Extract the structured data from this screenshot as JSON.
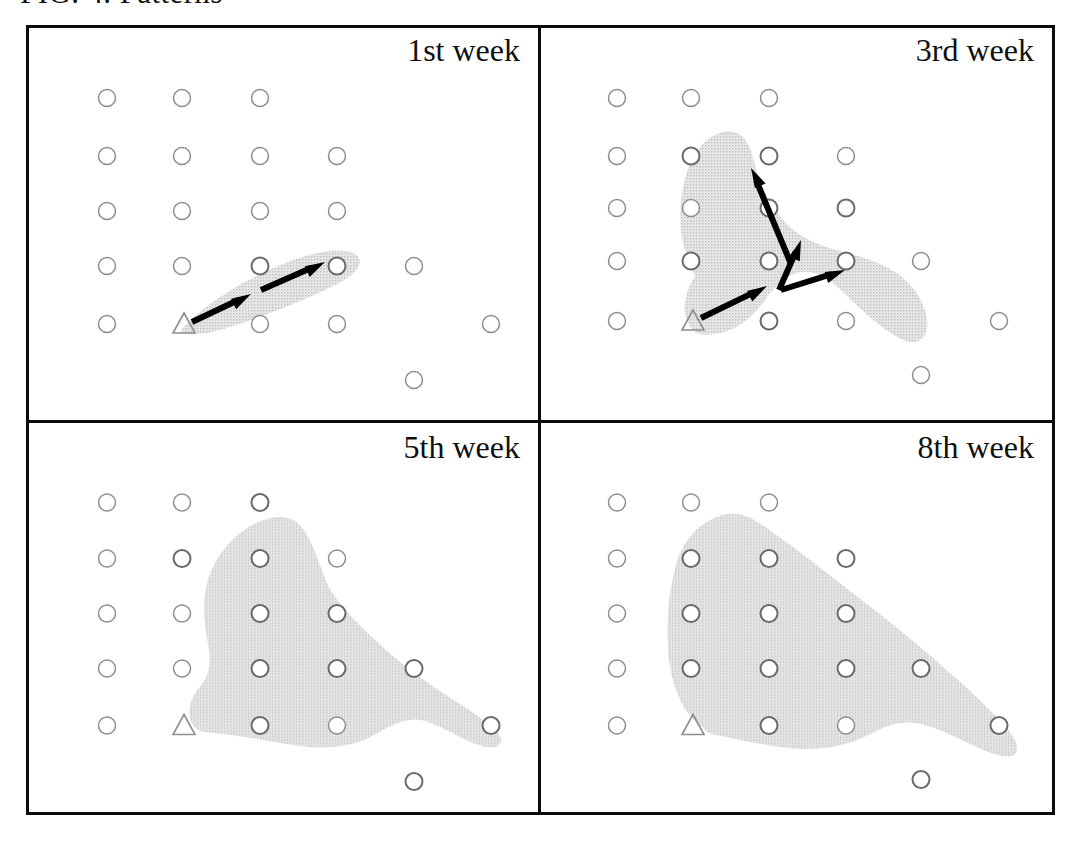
{
  "figure": {
    "caption": "FIG. 4. Patterns",
    "colors": {
      "frame": "#0b0b0b",
      "shade_fill": "#d9d9d9",
      "node_stroke": "#8e8e8e",
      "node_stroke_active": "#6a6a6a",
      "arrow": "#000000",
      "background": "#ffffff"
    },
    "legend_symbols": {
      "circle": "site-node",
      "triangle": "origin-node",
      "shaded_region": "diffusion-extent",
      "arrow": "spread-direction"
    }
  },
  "panels": [
    {
      "id": "panel-1st-week",
      "label": "1st week",
      "nodes": [
        {
          "x": 78,
          "y": 70,
          "shape": "circle",
          "inside": false
        },
        {
          "x": 153,
          "y": 70,
          "shape": "circle",
          "inside": false
        },
        {
          "x": 231,
          "y": 70,
          "shape": "circle",
          "inside": false
        },
        {
          "x": 78,
          "y": 128,
          "shape": "circle",
          "inside": false
        },
        {
          "x": 153,
          "y": 128,
          "shape": "circle",
          "inside": false
        },
        {
          "x": 231,
          "y": 128,
          "shape": "circle",
          "inside": false
        },
        {
          "x": 308,
          "y": 128,
          "shape": "circle",
          "inside": false
        },
        {
          "x": 78,
          "y": 183,
          "shape": "circle",
          "inside": false
        },
        {
          "x": 153,
          "y": 183,
          "shape": "circle",
          "inside": false
        },
        {
          "x": 231,
          "y": 183,
          "shape": "circle",
          "inside": false
        },
        {
          "x": 308,
          "y": 183,
          "shape": "circle",
          "inside": false
        },
        {
          "x": 78,
          "y": 238,
          "shape": "circle",
          "inside": false
        },
        {
          "x": 153,
          "y": 238,
          "shape": "circle",
          "inside": false
        },
        {
          "x": 231,
          "y": 238,
          "shape": "circle",
          "inside": true
        },
        {
          "x": 308,
          "y": 238,
          "shape": "circle",
          "inside": true
        },
        {
          "x": 385,
          "y": 238,
          "shape": "circle",
          "inside": false
        },
        {
          "x": 78,
          "y": 296,
          "shape": "circle",
          "inside": false
        },
        {
          "x": 155,
          "y": 296,
          "shape": "triangle",
          "inside": true
        },
        {
          "x": 231,
          "y": 296,
          "shape": "circle",
          "inside": false
        },
        {
          "x": 308,
          "y": 296,
          "shape": "circle",
          "inside": false
        },
        {
          "x": 462,
          "y": 296,
          "shape": "circle",
          "inside": false
        },
        {
          "x": 385,
          "y": 352,
          "shape": "circle",
          "inside": false
        }
      ],
      "region": "M 152 302 C 170 282 200 260 238 243 C 278 224 312 218 326 226 C 336 232 330 244 312 254 C 286 268 246 284 210 296 C 182 306 158 310 152 302 Z",
      "arrows": [
        {
          "x1": 163,
          "y1": 294,
          "x2": 222,
          "y2": 266
        },
        {
          "x1": 232,
          "y1": 262,
          "x2": 296,
          "y2": 234
        }
      ]
    },
    {
      "id": "panel-3rd-week",
      "label": "3rd week",
      "nodes": [
        {
          "x": 74,
          "y": 70,
          "shape": "circle",
          "inside": false
        },
        {
          "x": 148,
          "y": 70,
          "shape": "circle",
          "inside": false
        },
        {
          "x": 226,
          "y": 70,
          "shape": "circle",
          "inside": false
        },
        {
          "x": 74,
          "y": 128,
          "shape": "circle",
          "inside": false
        },
        {
          "x": 148,
          "y": 128,
          "shape": "circle",
          "inside": true
        },
        {
          "x": 226,
          "y": 128,
          "shape": "circle",
          "inside": true
        },
        {
          "x": 303,
          "y": 128,
          "shape": "circle",
          "inside": false
        },
        {
          "x": 74,
          "y": 180,
          "shape": "circle",
          "inside": false
        },
        {
          "x": 148,
          "y": 180,
          "shape": "circle",
          "inside": false
        },
        {
          "x": 226,
          "y": 180,
          "shape": "circle",
          "inside": true
        },
        {
          "x": 303,
          "y": 180,
          "shape": "circle",
          "inside": true
        },
        {
          "x": 74,
          "y": 233,
          "shape": "circle",
          "inside": false
        },
        {
          "x": 148,
          "y": 233,
          "shape": "circle",
          "inside": true
        },
        {
          "x": 226,
          "y": 233,
          "shape": "circle",
          "inside": true
        },
        {
          "x": 303,
          "y": 233,
          "shape": "circle",
          "inside": true
        },
        {
          "x": 378,
          "y": 233,
          "shape": "circle",
          "inside": false
        },
        {
          "x": 74,
          "y": 293,
          "shape": "circle",
          "inside": false
        },
        {
          "x": 150,
          "y": 293,
          "shape": "triangle",
          "inside": true
        },
        {
          "x": 226,
          "y": 293,
          "shape": "circle",
          "inside": true
        },
        {
          "x": 303,
          "y": 293,
          "shape": "circle",
          "inside": false
        },
        {
          "x": 456,
          "y": 293,
          "shape": "circle",
          "inside": false
        },
        {
          "x": 378,
          "y": 347,
          "shape": "circle",
          "inside": false
        }
      ],
      "region": "M 148 300 C 138 286 140 268 152 248 C 138 222 134 190 140 160 C 146 128 162 108 180 104 C 196 100 206 112 210 130 C 216 154 226 176 240 192 C 252 206 268 214 286 220 C 306 226 330 230 352 244 C 374 258 386 282 384 300 C 382 314 370 318 356 310 C 338 300 318 282 300 264 C 286 250 272 242 258 244 C 244 246 232 258 222 272 C 208 292 190 304 172 306 C 160 308 152 306 148 300 Z",
      "arrows": [
        {
          "x1": 158,
          "y1": 290,
          "x2": 224,
          "y2": 258
        },
        {
          "x1": 248,
          "y1": 236,
          "x2": 208,
          "y2": 140
        },
        {
          "x1": 236,
          "y1": 262,
          "x2": 258,
          "y2": 212
        },
        {
          "x1": 238,
          "y1": 262,
          "x2": 302,
          "y2": 242
        }
      ]
    },
    {
      "id": "panel-5th-week",
      "label": "5th week",
      "nodes": [
        {
          "x": 78,
          "y": 75,
          "shape": "circle",
          "inside": false
        },
        {
          "x": 153,
          "y": 75,
          "shape": "circle",
          "inside": false
        },
        {
          "x": 231,
          "y": 75,
          "shape": "circle",
          "inside": true
        },
        {
          "x": 78,
          "y": 131,
          "shape": "circle",
          "inside": false
        },
        {
          "x": 153,
          "y": 131,
          "shape": "circle",
          "inside": true
        },
        {
          "x": 231,
          "y": 131,
          "shape": "circle",
          "inside": true
        },
        {
          "x": 308,
          "y": 131,
          "shape": "circle",
          "inside": false
        },
        {
          "x": 78,
          "y": 186,
          "shape": "circle",
          "inside": false
        },
        {
          "x": 153,
          "y": 186,
          "shape": "circle",
          "inside": false
        },
        {
          "x": 231,
          "y": 186,
          "shape": "circle",
          "inside": true
        },
        {
          "x": 308,
          "y": 186,
          "shape": "circle",
          "inside": true
        },
        {
          "x": 78,
          "y": 241,
          "shape": "circle",
          "inside": false
        },
        {
          "x": 153,
          "y": 241,
          "shape": "circle",
          "inside": false
        },
        {
          "x": 231,
          "y": 241,
          "shape": "circle",
          "inside": true
        },
        {
          "x": 308,
          "y": 241,
          "shape": "circle",
          "inside": true
        },
        {
          "x": 385,
          "y": 241,
          "shape": "circle",
          "inside": true
        },
        {
          "x": 78,
          "y": 298,
          "shape": "circle",
          "inside": false
        },
        {
          "x": 155,
          "y": 298,
          "shape": "triangle",
          "inside": false
        },
        {
          "x": 231,
          "y": 298,
          "shape": "circle",
          "inside": true
        },
        {
          "x": 308,
          "y": 298,
          "shape": "circle",
          "inside": false
        },
        {
          "x": 462,
          "y": 298,
          "shape": "circle",
          "inside": true
        },
        {
          "x": 385,
          "y": 354,
          "shape": "circle",
          "inside": true
        }
      ],
      "region": "M 166 300 C 156 288 160 272 172 258 C 180 248 182 236 180 222 C 176 200 172 178 178 156 C 184 132 202 108 226 96 C 248 85 266 88 276 104 C 288 124 292 144 300 160 C 310 178 330 198 352 218 C 376 240 402 258 430 276 C 458 294 474 306 472 314 C 470 322 456 322 436 312 C 418 303 400 292 386 292 C 370 292 356 302 340 310 C 320 320 296 322 268 318 C 240 314 212 308 190 306 C 176 305 170 304 166 300 Z",
      "arrows": []
    },
    {
      "id": "panel-8th-week",
      "label": "8th week",
      "nodes": [
        {
          "x": 74,
          "y": 75,
          "shape": "circle",
          "inside": false
        },
        {
          "x": 148,
          "y": 75,
          "shape": "circle",
          "inside": false
        },
        {
          "x": 226,
          "y": 75,
          "shape": "circle",
          "inside": false
        },
        {
          "x": 74,
          "y": 131,
          "shape": "circle",
          "inside": false
        },
        {
          "x": 148,
          "y": 131,
          "shape": "circle",
          "inside": true
        },
        {
          "x": 226,
          "y": 131,
          "shape": "circle",
          "inside": true
        },
        {
          "x": 303,
          "y": 131,
          "shape": "circle",
          "inside": true
        },
        {
          "x": 74,
          "y": 186,
          "shape": "circle",
          "inside": false
        },
        {
          "x": 148,
          "y": 186,
          "shape": "circle",
          "inside": true
        },
        {
          "x": 226,
          "y": 186,
          "shape": "circle",
          "inside": true
        },
        {
          "x": 303,
          "y": 186,
          "shape": "circle",
          "inside": true
        },
        {
          "x": 74,
          "y": 241,
          "shape": "circle",
          "inside": false
        },
        {
          "x": 148,
          "y": 241,
          "shape": "circle",
          "inside": true
        },
        {
          "x": 226,
          "y": 241,
          "shape": "circle",
          "inside": true
        },
        {
          "x": 303,
          "y": 241,
          "shape": "circle",
          "inside": true
        },
        {
          "x": 378,
          "y": 241,
          "shape": "circle",
          "inside": true
        },
        {
          "x": 74,
          "y": 298,
          "shape": "circle",
          "inside": false
        },
        {
          "x": 150,
          "y": 298,
          "shape": "triangle",
          "inside": false
        },
        {
          "x": 226,
          "y": 298,
          "shape": "circle",
          "inside": true
        },
        {
          "x": 303,
          "y": 298,
          "shape": "circle",
          "inside": false
        },
        {
          "x": 456,
          "y": 298,
          "shape": "circle",
          "inside": true
        },
        {
          "x": 378,
          "y": 352,
          "shape": "circle",
          "inside": true
        }
      ],
      "region": "M 160 300 C 142 288 130 264 126 232 C 122 198 126 160 134 134 C 142 110 158 94 178 88 C 196 83 208 90 220 98 C 246 116 272 136 300 158 C 334 184 372 214 410 248 C 448 282 472 306 474 318 C 476 330 464 332 444 324 C 420 314 396 300 376 296 C 356 292 340 300 324 308 C 300 320 272 324 242 320 C 210 316 184 310 168 306 C 162 304 161 302 160 300 Z",
      "arrows": []
    }
  ]
}
